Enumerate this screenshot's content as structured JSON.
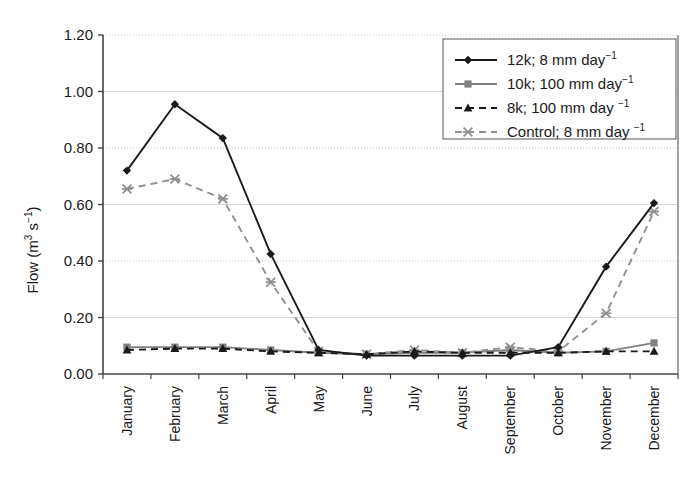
{
  "chart_data": {
    "type": "line",
    "title": "",
    "xlabel": "",
    "ylabel": "Flow (m3 s-1)",
    "ylabel_parts": {
      "base": "Flow (m",
      "exp1": "3",
      "mid": " s",
      "exp2": "−1",
      "tail": ")"
    },
    "ylim": [
      0.0,
      1.2
    ],
    "ytick_values": [
      0.0,
      0.2,
      0.4,
      0.6,
      0.8,
      1.0,
      1.2
    ],
    "ytick_labels": [
      "0.00",
      "0.20",
      "0.40",
      "0.60",
      "0.80",
      "1.00",
      "1.20"
    ],
    "grid": "horizontal",
    "legend_position": "top-right",
    "categories": [
      "January",
      "February",
      "March",
      "April",
      "May",
      "June",
      "July",
      "August",
      "September",
      "October",
      "November",
      "December"
    ],
    "series": [
      {
        "name": "12k; 8 mm day-1",
        "label_parts": {
          "text": "12k; 8 mm day",
          "exp": "−1"
        },
        "marker": "diamond",
        "line": "solid",
        "color": "#1a1a1a",
        "values": [
          0.72,
          0.955,
          0.835,
          0.425,
          0.085,
          0.065,
          0.065,
          0.065,
          0.065,
          0.095,
          0.38,
          0.605
        ]
      },
      {
        "name": "10k; 100 mm day-1",
        "label_parts": {
          "text": "10k; 100 mm day",
          "exp": "−1"
        },
        "marker": "square",
        "line": "solid",
        "color": "#808080",
        "values": [
          0.095,
          0.095,
          0.095,
          0.085,
          0.075,
          0.07,
          0.075,
          0.075,
          0.085,
          0.075,
          0.08,
          0.11
        ]
      },
      {
        "name": "8k; 100 mm day-1",
        "label_parts": {
          "text": "8k; 100 mm day ",
          "exp": "−1"
        },
        "marker": "triangle",
        "line": "dashed",
        "color": "#1a1a1a",
        "values": [
          0.085,
          0.09,
          0.09,
          0.08,
          0.075,
          0.07,
          0.08,
          0.075,
          0.075,
          0.075,
          0.08,
          0.08
        ]
      },
      {
        "name": "Control; 8 mm day-1",
        "label_parts": {
          "text": "Control; 8 mm day ",
          "exp": "−1"
        },
        "marker": "cross",
        "line": "dashed",
        "color": "#909090",
        "values": [
          0.655,
          0.69,
          0.62,
          0.325,
          0.08,
          0.07,
          0.085,
          0.075,
          0.095,
          0.08,
          0.215,
          0.575
        ]
      }
    ]
  }
}
